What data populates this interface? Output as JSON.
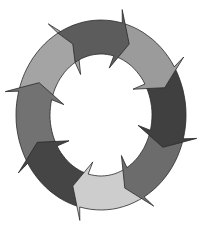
{
  "diagram": {
    "type": "cycle",
    "direction": "clockwise",
    "segment_count": 8,
    "center": [
      101,
      115
    ],
    "outer_radius": [
      85,
      95
    ],
    "inner_radius": [
      51,
      61
    ],
    "segments": [
      {
        "name": "segment-top",
        "color": "#5c5c5c"
      },
      {
        "name": "segment-top-right",
        "color": "#9b9b9b"
      },
      {
        "name": "segment-right",
        "color": "#404040"
      },
      {
        "name": "segment-bottom-right",
        "color": "#6c6c6c"
      },
      {
        "name": "segment-bottom",
        "color": "#cdcdcd"
      },
      {
        "name": "segment-bottom-left",
        "color": "#454545"
      },
      {
        "name": "segment-left",
        "color": "#727272"
      },
      {
        "name": "segment-top-left",
        "color": "#a4a4a4"
      }
    ],
    "outline_color": "#2a2a2a",
    "background": "#ffffff"
  }
}
